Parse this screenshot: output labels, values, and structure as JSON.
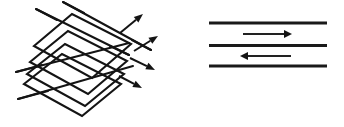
{
  "figure": {
    "title": "",
    "background_color": "#ffffff",
    "ink_color": "#141414",
    "width": 344,
    "height": 127
  },
  "left_diagram": {
    "name": "stacked-plates-perspective",
    "description": "Stack of parallelogram plates in isometric view with rays passing through and exiting as arrows",
    "plate_count": 4,
    "stroke_color": "#141414",
    "stroke_width": 2.1,
    "plates": [
      {
        "index": 0,
        "label": "",
        "points": "34,46 72,14 131,44 92,78"
      },
      {
        "index": 1,
        "label": "",
        "points": "30,62 68,31 127,61 88,94"
      },
      {
        "index": 2,
        "label": "",
        "points": "27,74 65,44 124,74 85,106"
      },
      {
        "index": 3,
        "label": "",
        "points": "24,84 62,54 121,84 82,116"
      }
    ],
    "rays": [
      {
        "index": 0,
        "label": "",
        "x1": 36,
        "y1": 9,
        "x2": 129,
        "y2": 55
      },
      {
        "index": 1,
        "label": "",
        "x1": 63,
        "y1": 2,
        "x2": 151,
        "y2": 50
      },
      {
        "index": 2,
        "label": "",
        "x1": 16,
        "y1": 72,
        "x2": 129,
        "y2": 43
      },
      {
        "index": 3,
        "label": "",
        "x1": 18,
        "y1": 99,
        "x2": 133,
        "y2": 66
      }
    ],
    "arrows": [
      {
        "index": 0,
        "label": "",
        "direction": "up-right",
        "tip_x": 143,
        "tip_y": 14,
        "tail_x": 120,
        "tail_y": 33
      },
      {
        "index": 1,
        "label": "",
        "direction": "up-right",
        "tip_x": 158,
        "tip_y": 36,
        "tail_x": 134,
        "tail_y": 51
      },
      {
        "index": 2,
        "label": "",
        "direction": "down-right",
        "tip_x": 155,
        "tip_y": 70,
        "tail_x": 130,
        "tail_y": 58
      },
      {
        "index": 3,
        "label": "",
        "direction": "down-right",
        "tip_x": 142,
        "tip_y": 88,
        "tail_x": 119,
        "tail_y": 76
      }
    ]
  },
  "right_diagram": {
    "name": "layered-horizontal-lines",
    "description": "Three thick horizontal layer lines with alternating flow arrows between them",
    "line_count": 3,
    "stroke_color": "#1a1a1a",
    "stroke_width": 3.0,
    "lines": [
      {
        "index": 0,
        "label": "",
        "x1": 209,
        "y": 23,
        "x2": 327
      },
      {
        "index": 1,
        "label": "",
        "x1": 209,
        "y": 45.5,
        "x2": 327
      },
      {
        "index": 2,
        "label": "",
        "x1": 209,
        "y": 66,
        "x2": 327
      }
    ],
    "flow_arrows": [
      {
        "index": 0,
        "label": "",
        "direction": "right",
        "between_lines": "0-1",
        "x_start": 243,
        "x_end": 292,
        "y": 34
      },
      {
        "index": 1,
        "label": "",
        "direction": "left",
        "between_lines": "1-2",
        "x_start": 291,
        "x_end": 240,
        "y": 56
      }
    ]
  }
}
